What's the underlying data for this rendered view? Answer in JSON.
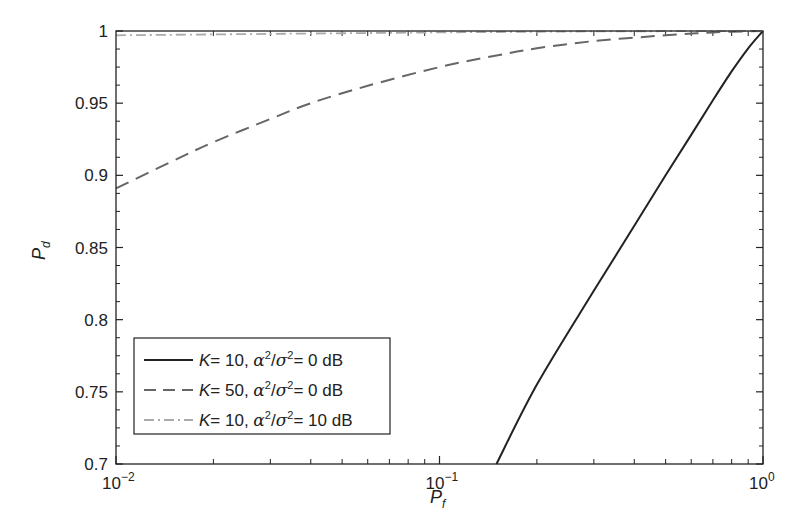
{
  "chart_data": {
    "type": "line",
    "title": "",
    "xlabel": "P_f",
    "ylabel": "P_d",
    "xscale": "log",
    "xlim": [
      0.01,
      1
    ],
    "ylim": [
      0.7,
      1.0
    ],
    "grid": false,
    "legend_position": "lower left",
    "x_ticks": [
      {
        "value": 0.01,
        "base": "10",
        "exp": "−2"
      },
      {
        "value": 0.1,
        "base": "10",
        "exp": "−1"
      },
      {
        "value": 1,
        "base": "10",
        "exp": "0"
      }
    ],
    "y_ticks": [
      "0.7",
      "0.75",
      "0.8",
      "0.85",
      "0.9",
      "0.95",
      "1"
    ],
    "series": [
      {
        "name": "K = 10, α²/σ² = 0 dB",
        "legend": {
          "k": "K",
          "kval": "= 10, ",
          "snr": "= 0 dB"
        },
        "style": "solid",
        "color": "#222222",
        "x": [
          0.15,
          0.2,
          0.3,
          0.4,
          0.5,
          0.6,
          0.7,
          0.8,
          0.9,
          1.0
        ],
        "y": [
          0.7,
          0.755,
          0.82,
          0.865,
          0.9,
          0.928,
          0.952,
          0.972,
          0.988,
          1.0
        ]
      },
      {
        "name": "K = 50, α²/σ² = 0 dB",
        "legend": {
          "k": "K",
          "kval": "= 50, ",
          "snr": "= 0 dB"
        },
        "style": "dashed",
        "color": "#666666",
        "x": [
          0.01,
          0.015,
          0.02,
          0.03,
          0.04,
          0.06,
          0.1,
          0.15,
          0.2,
          0.3,
          0.5,
          0.7,
          1.0
        ],
        "y": [
          0.891,
          0.91,
          0.923,
          0.939,
          0.95,
          0.962,
          0.975,
          0.983,
          0.988,
          0.993,
          0.997,
          0.999,
          1.0
        ]
      },
      {
        "name": "K = 10, α²/σ² = 10 dB",
        "legend": {
          "k": "K",
          "kval": "= 10, ",
          "snr": "= 10 dB"
        },
        "style": "dashdot",
        "color": "#aaaaaa",
        "x": [
          0.01,
          0.03,
          0.1,
          0.3,
          1.0
        ],
        "y": [
          0.997,
          0.998,
          0.999,
          0.9997,
          1.0
        ]
      }
    ]
  }
}
